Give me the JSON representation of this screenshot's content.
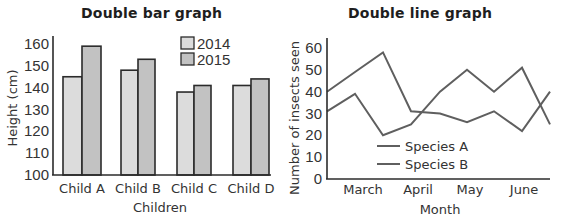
{
  "chart_data": [
    {
      "type": "bar",
      "title": "Double bar graph",
      "xlabel": "Children",
      "ylabel": "Height (cm)",
      "ylim": [
        100,
        160
      ],
      "yticks": [
        100,
        110,
        120,
        130,
        140,
        150,
        160
      ],
      "categories": [
        "Child A",
        "Child B",
        "Child C",
        "Child D"
      ],
      "series": [
        {
          "name": "2014",
          "values": [
            145,
            148,
            138,
            141
          ],
          "color": "#dcdcdc"
        },
        {
          "name": "2015",
          "values": [
            159,
            153,
            141,
            144
          ],
          "color": "#c2c2c2"
        }
      ],
      "grid": false,
      "legend_position": "top-right"
    },
    {
      "type": "line",
      "title": "Double line graph",
      "xlabel": "Month",
      "ylabel": "Number of insects seen",
      "ylim": [
        0,
        60
      ],
      "yticks": [
        0,
        10,
        20,
        30,
        40,
        50,
        60
      ],
      "x_tick_labels": [
        "March",
        "April",
        "May",
        "June"
      ],
      "x": [
        0,
        1,
        2,
        3,
        4,
        5,
        6,
        7,
        8
      ],
      "series": [
        {
          "name": "Species A",
          "values": [
            40,
            49,
            58,
            31,
            30,
            26,
            31,
            22,
            40
          ],
          "color": "#5f5f5f"
        },
        {
          "name": "Species B",
          "values": [
            31,
            39,
            20,
            25,
            40,
            50,
            40,
            51,
            25
          ],
          "color": "#5f5f5f"
        }
      ],
      "grid": false,
      "legend_position": "bottom-left"
    }
  ],
  "bar_chart": {
    "title": "Double bar graph",
    "ylabel": "Height (cm)",
    "xlabel": "Children",
    "yticks": [
      "100",
      "110",
      "120",
      "130",
      "140",
      "150",
      "160"
    ],
    "categories": [
      "Child A",
      "Child B",
      "Child C",
      "Child D"
    ],
    "legend": [
      "2014",
      "2015"
    ]
  },
  "line_chart": {
    "title": "Double line graph",
    "ylabel": "Number of insects seen",
    "xlabel": "Month",
    "yticks": [
      "0",
      "10",
      "20",
      "30",
      "40",
      "50",
      "60"
    ],
    "months": [
      "March",
      "April",
      "May",
      "June"
    ],
    "legend": [
      "Species A",
      "Species B"
    ]
  }
}
